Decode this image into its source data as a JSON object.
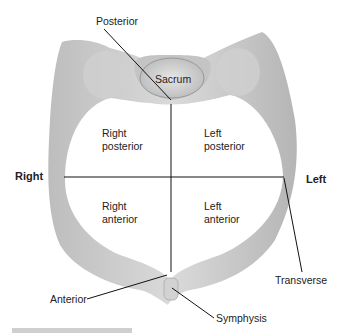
{
  "diagram": {
    "labels": {
      "posterior": "Posterior",
      "sacrum": "Sacrum",
      "right_posterior": [
        "Right",
        "posterior"
      ],
      "left_posterior": [
        "Left",
        "posterior"
      ],
      "right": "Right",
      "left": "Left",
      "right_anterior": [
        "Right",
        "anterior"
      ],
      "left_anterior": [
        "Left",
        "anterior"
      ],
      "transverse": "Transverse",
      "anterior": "Anterior",
      "symphysis": "Symphysis"
    },
    "colors": {
      "bone_light": "#e8e8e8",
      "bone_mid": "#c8c8c8",
      "bone_dark": "#9a9a9a",
      "lines": "#111111"
    },
    "caption_partial": "Fig... 10-10"
  }
}
